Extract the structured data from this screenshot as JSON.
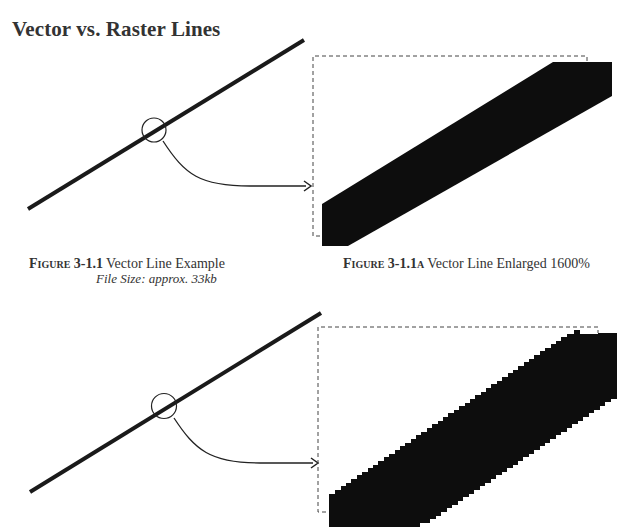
{
  "page": {
    "title": "Vector vs. Raster Lines"
  },
  "figures": [
    {
      "id": "figure-3-1-1",
      "label": "Figure 3-1.1",
      "text": "Vector Line Example",
      "file_size": "File Size: approx. 33kb"
    },
    {
      "id": "figure-3-1-1a",
      "label": "Figure 3-1.1a",
      "text": "Vector Line Enlarged 1600%"
    }
  ],
  "colors": {
    "line": "#1a1a1a",
    "fill": "#0d0d0d",
    "dash": "#444444",
    "text": "#333333"
  }
}
